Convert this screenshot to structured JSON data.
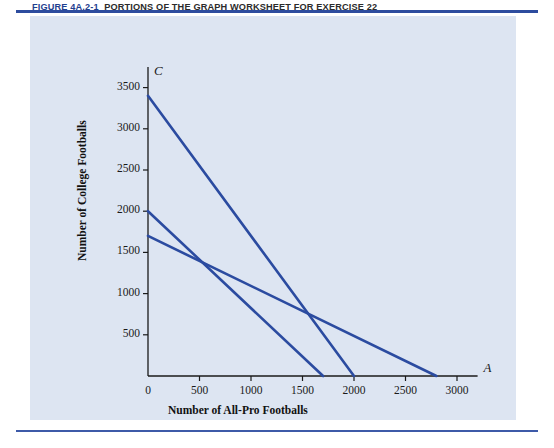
{
  "figure": {
    "caption_number": "FIGURE 4A.2-1",
    "caption_text": "PORTIONS OF THE GRAPH WORKSHEET FOR EXERCISE 22",
    "rule_color": "#2d4c9e",
    "panel_color": "#dde5f2"
  },
  "chart_data": {
    "type": "line",
    "title": "",
    "xlabel": "Number of All-Pro Footballs",
    "ylabel": "Number of College Footballs",
    "x_axis_letter": "A",
    "y_axis_letter": "C",
    "xlim": [
      0,
      3200
    ],
    "ylim": [
      0,
      3750
    ],
    "xticks": [
      0,
      500,
      1000,
      1500,
      2000,
      2500,
      3000
    ],
    "yticks": [
      500,
      1000,
      1500,
      2000,
      2500,
      3000,
      3500
    ],
    "xtick_labels": [
      "0",
      "500",
      "1000",
      "1500",
      "2000",
      "2500",
      "3000"
    ],
    "ytick_labels": [
      "500",
      "1000",
      "1500",
      "2000",
      "2500",
      "3000",
      "3500"
    ],
    "grid": false,
    "legend": "none",
    "line_color": "#2b4ba0",
    "series": [
      {
        "name": "constraint-1",
        "points": [
          [
            0,
            3400
          ],
          [
            2000,
            0
          ]
        ]
      },
      {
        "name": "constraint-2",
        "points": [
          [
            0,
            2000
          ],
          [
            1700,
            0
          ]
        ]
      },
      {
        "name": "constraint-3",
        "points": [
          [
            0,
            1700
          ],
          [
            2800,
            0
          ]
        ]
      }
    ]
  }
}
